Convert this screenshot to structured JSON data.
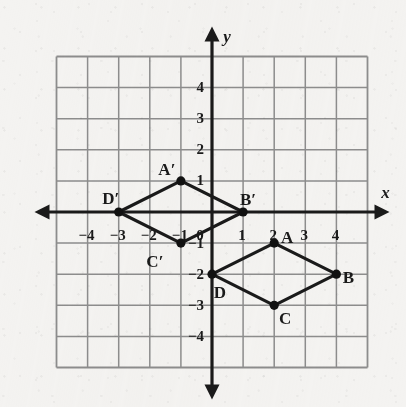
{
  "figure": {
    "axis_labels": {
      "x": "x",
      "y": "y"
    },
    "colors": {
      "paper": "#f4f3f1",
      "grid": "#8d8d8d",
      "grid_minor": "#b9b9b9",
      "axis": "#1a1a1a",
      "shape_stroke": "#1a1a1a",
      "vertex_fill": "#111111"
    }
  },
  "chart_data": {
    "type": "scatter",
    "title": "",
    "xlabel": "x",
    "ylabel": "y",
    "xlim": [
      -5,
      5
    ],
    "ylim": [
      -5,
      5
    ],
    "grid": true,
    "legend": "none",
    "x_ticks": [
      -4,
      -3,
      -2,
      -1,
      0,
      1,
      2,
      3,
      4
    ],
    "y_ticks": [
      4,
      3,
      2,
      1,
      -1,
      -2,
      -3,
      -4
    ],
    "x_tick_labels": [
      "-4",
      "-3",
      "-2",
      "-1",
      "0",
      "1",
      "2",
      "3",
      "4"
    ],
    "y_tick_labels": [
      "4",
      "3",
      "2",
      "1",
      "-1",
      "-2",
      "-3",
      "-4"
    ],
    "origin_label": "0",
    "series": [
      {
        "name": "ABCD",
        "closed": true,
        "points": [
          {
            "label": "A",
            "x": 2,
            "y": -1,
            "label_dx": 13,
            "label_dy": -4
          },
          {
            "label": "B",
            "x": 4,
            "y": -2,
            "label_dx": 12,
            "label_dy": 5
          },
          {
            "label": "C",
            "x": 2,
            "y": -3,
            "label_dx": 11,
            "label_dy": 15
          },
          {
            "label": "D",
            "x": 0,
            "y": -2,
            "label_dx": 8,
            "label_dy": 20
          }
        ]
      },
      {
        "name": "A'B'C'D'",
        "closed": true,
        "points": [
          {
            "label": "A′",
            "x": -1,
            "y": 1,
            "label_dx": -14,
            "label_dy": -10
          },
          {
            "label": "B′",
            "x": 1,
            "y": 0,
            "label_dx": 5,
            "label_dy": -11
          },
          {
            "label": "C′",
            "x": -1,
            "y": -1,
            "label_dx": -26,
            "label_dy": 20
          },
          {
            "label": "D′",
            "x": -3,
            "y": 0,
            "label_dx": -8,
            "label_dy": -12
          }
        ]
      }
    ]
  }
}
